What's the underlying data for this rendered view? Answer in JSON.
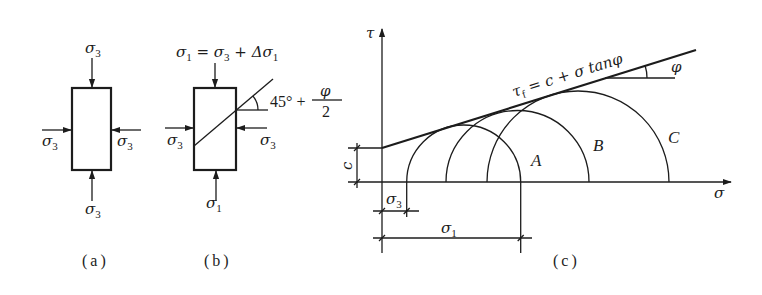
{
  "figure": {
    "panel_a": {
      "caption": "(a)",
      "top_load": {
        "symbol": "σ",
        "sub": "3"
      },
      "bottom_load": {
        "symbol": "σ",
        "sub": "3"
      },
      "left_load": {
        "symbol": "σ",
        "sub": "3"
      },
      "right_load": {
        "symbol": "σ",
        "sub": "3"
      }
    },
    "panel_b": {
      "caption": "(b)",
      "top_equation": {
        "parts": [
          {
            "text": "σ"
          },
          {
            "text": "1"
          },
          {
            "text": " = σ"
          },
          {
            "text": "3"
          },
          {
            "text": " + Δσ"
          },
          {
            "text": "1"
          }
        ]
      },
      "failure_plane_angle": {
        "prefix": "45° + ",
        "numerator": "φ",
        "denominator": "2"
      },
      "left_load": {
        "symbol": "σ",
        "sub": "3"
      },
      "right_load": {
        "symbol": "σ",
        "sub": "3"
      },
      "bottom_load": {
        "symbol": "σ",
        "sub": "1"
      }
    },
    "panel_c": {
      "caption": "(c)",
      "tau_axis_label": "τ",
      "sigma_axis_label": "σ",
      "envelope_equation": {
        "base": "τ",
        "sub": "f",
        "rest": " = c + σ tan",
        "angle": "φ"
      },
      "friction_angle_label": "φ",
      "cohesion_label": "c",
      "circles": [
        {
          "label": "A"
        },
        {
          "label": "B"
        },
        {
          "label": "C"
        }
      ],
      "sigma3_dimension": {
        "symbol": "σ",
        "sub": "3"
      },
      "sigma1_dimension": {
        "symbol": "σ",
        "sub": "1"
      }
    }
  }
}
